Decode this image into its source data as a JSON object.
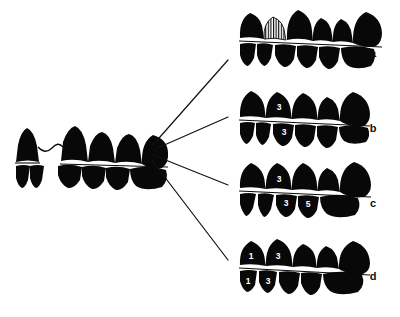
{
  "figure": {
    "type": "diagram",
    "title": "",
    "caption": "",
    "background_color": "#ffffff",
    "ink_color": "#080808",
    "label_color": "#111111",
    "number_color": "#ffffff",
    "width": 400,
    "height": 317
  },
  "source": {
    "name": "ancestral-dentition",
    "description": "left dentition with diastema",
    "position": {
      "x": 14,
      "y": 128
    },
    "upper_teeth": [
      {
        "index": 0,
        "label": "",
        "shape": "incisor",
        "fill": "solid"
      },
      {
        "index": 1,
        "label": "",
        "shape": "canine",
        "fill": "solid"
      },
      {
        "index": 2,
        "label": "",
        "shape": "premolar",
        "fill": "solid"
      },
      {
        "index": 3,
        "label": "",
        "shape": "premolar",
        "fill": "solid"
      },
      {
        "index": 4,
        "label": "",
        "shape": "molar",
        "fill": "solid"
      }
    ],
    "lower_teeth": [
      {
        "index": 0,
        "label": "",
        "shape": "incisor",
        "fill": "solid"
      },
      {
        "index": 1,
        "label": "",
        "shape": "incisor",
        "fill": "solid"
      },
      {
        "index": 2,
        "label": "",
        "shape": "premolar",
        "fill": "solid"
      },
      {
        "index": 3,
        "label": "",
        "shape": "premolar",
        "fill": "solid"
      },
      {
        "index": 4,
        "label": "",
        "shape": "molar",
        "fill": "solid"
      }
    ],
    "has_diastema": true,
    "diastema_connector": "wavy-link"
  },
  "branches": {
    "origin": {
      "x": 150,
      "y": 150
    },
    "lines": [
      {
        "name": "branch-to-a",
        "x1": 152,
        "y1": 146,
        "x2": 228,
        "y2": 60
      },
      {
        "name": "branch-to-b",
        "x1": 153,
        "y1": 150,
        "x2": 228,
        "y2": 117
      },
      {
        "name": "branch-to-c",
        "x1": 153,
        "y1": 155,
        "x2": 228,
        "y2": 185
      },
      {
        "name": "branch-to-d",
        "x1": 151,
        "y1": 159,
        "x2": 228,
        "y2": 260
      }
    ]
  },
  "panels": [
    {
      "id": "a",
      "label": "a",
      "label_position": {
        "x": 373,
        "y": 57
      },
      "origin": {
        "x": 238,
        "y": 8
      },
      "upper_teeth": [
        {
          "index": 0,
          "label": "",
          "fill": "solid"
        },
        {
          "index": 1,
          "label": "",
          "fill": "hatched"
        },
        {
          "index": 2,
          "label": "",
          "fill": "solid"
        },
        {
          "index": 3,
          "label": "",
          "fill": "solid"
        },
        {
          "index": 4,
          "label": "",
          "fill": "solid"
        },
        {
          "index": 5,
          "label": "",
          "fill": "solid"
        }
      ],
      "lower_teeth": [
        {
          "index": 0,
          "label": "",
          "fill": "solid"
        },
        {
          "index": 1,
          "label": "",
          "fill": "solid"
        },
        {
          "index": 2,
          "label": "",
          "fill": "solid"
        },
        {
          "index": 3,
          "label": "",
          "fill": "solid"
        },
        {
          "index": 4,
          "label": "",
          "fill": "solid"
        },
        {
          "index": 5,
          "label": "",
          "fill": "solid"
        }
      ]
    },
    {
      "id": "b",
      "label": "b",
      "label_position": {
        "x": 373,
        "y": 132
      },
      "origin": {
        "x": 238,
        "y": 88
      },
      "upper_teeth": [
        {
          "index": 0,
          "label": "",
          "fill": "solid"
        },
        {
          "index": 1,
          "label": "3",
          "fill": "solid"
        },
        {
          "index": 2,
          "label": "",
          "fill": "solid"
        },
        {
          "index": 3,
          "label": "",
          "fill": "solid"
        },
        {
          "index": 4,
          "label": "",
          "fill": "solid"
        }
      ],
      "lower_teeth": [
        {
          "index": 0,
          "label": "",
          "fill": "solid"
        },
        {
          "index": 1,
          "label": "",
          "fill": "solid"
        },
        {
          "index": 2,
          "label": "3",
          "fill": "solid"
        },
        {
          "index": 3,
          "label": "",
          "fill": "solid"
        },
        {
          "index": 4,
          "label": "",
          "fill": "solid"
        },
        {
          "index": 5,
          "label": "",
          "fill": "solid"
        }
      ]
    },
    {
      "id": "c",
      "label": "c",
      "label_position": {
        "x": 373,
        "y": 207
      },
      "origin": {
        "x": 238,
        "y": 162
      },
      "upper_teeth": [
        {
          "index": 0,
          "label": "",
          "fill": "solid"
        },
        {
          "index": 1,
          "label": "3",
          "fill": "solid"
        },
        {
          "index": 2,
          "label": "",
          "fill": "solid"
        },
        {
          "index": 3,
          "label": "",
          "fill": "solid"
        },
        {
          "index": 4,
          "label": "",
          "fill": "solid"
        }
      ],
      "lower_teeth": [
        {
          "index": 0,
          "label": "",
          "fill": "solid"
        },
        {
          "index": 1,
          "label": "",
          "fill": "solid"
        },
        {
          "index": 2,
          "label": "3",
          "fill": "solid"
        },
        {
          "index": 3,
          "label": "5",
          "fill": "solid"
        },
        {
          "index": 4,
          "label": "",
          "fill": "solid"
        }
      ]
    },
    {
      "id": "d",
      "label": "d",
      "label_position": {
        "x": 373,
        "y": 280
      },
      "origin": {
        "x": 238,
        "y": 238
      },
      "upper_teeth": [
        {
          "index": 0,
          "label": "1",
          "fill": "solid"
        },
        {
          "index": 1,
          "label": "3",
          "fill": "solid"
        },
        {
          "index": 2,
          "label": "",
          "fill": "solid"
        },
        {
          "index": 3,
          "label": "",
          "fill": "solid"
        },
        {
          "index": 4,
          "label": "",
          "fill": "solid"
        }
      ],
      "lower_teeth": [
        {
          "index": 0,
          "label": "1",
          "fill": "solid"
        },
        {
          "index": 1,
          "label": "3",
          "fill": "solid"
        },
        {
          "index": 2,
          "label": "",
          "fill": "solid"
        },
        {
          "index": 3,
          "label": "",
          "fill": "solid"
        },
        {
          "index": 4,
          "label": "",
          "fill": "solid"
        }
      ]
    }
  ]
}
